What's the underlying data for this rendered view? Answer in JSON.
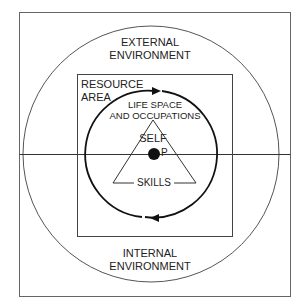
{
  "diagram": {
    "labels": {
      "external": [
        "EXTERNAL",
        "ENVIRONMENT"
      ],
      "resource": [
        "RESOURCE",
        "AREA"
      ],
      "life_space": [
        "LIFE SPACE",
        "AND OCCUPATIONS"
      ],
      "self": "SELF",
      "person": "P",
      "skills": "SKILLS",
      "internal": [
        "INTERNAL",
        "ENVIRONMENT"
      ]
    },
    "colors": {
      "line": "#333333",
      "dark": "#111111",
      "background": "#ffffff"
    }
  }
}
